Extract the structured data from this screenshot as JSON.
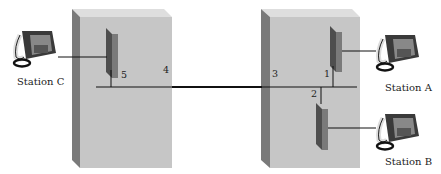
{
  "diagram": {
    "type": "telephone network across two buildings",
    "buildings": [
      {
        "id": "left-building",
        "ports": [
          "5",
          "4"
        ]
      },
      {
        "id": "right-building",
        "ports": [
          "3",
          "1",
          "2"
        ]
      }
    ],
    "stations": [
      {
        "id": "station-c",
        "label": "Station C"
      },
      {
        "id": "station-a",
        "label": "Station A"
      },
      {
        "id": "station-b",
        "label": "Station B"
      }
    ],
    "points": {
      "p1": "1",
      "p2": "2",
      "p3": "3",
      "p4": "4",
      "p5": "5"
    },
    "colors": {
      "building_front": "#c4c4c4",
      "building_side": "#7a7a7a",
      "building_top": "#dcdcdc",
      "panel": "#6e6e6e",
      "line": "#111111"
    }
  }
}
